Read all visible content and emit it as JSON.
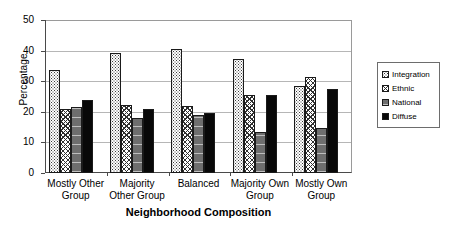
{
  "chart_data": {
    "type": "bar",
    "title": "",
    "xlabel": "Neighborhood Composition",
    "ylabel": "Percentage",
    "ylim": [
      0,
      50
    ],
    "yticks": [
      0,
      10,
      20,
      30,
      40,
      50
    ],
    "grid": true,
    "legend_position": "right",
    "categories": [
      "Mostly Other Group",
      "Majority Other Group",
      "Balanced",
      "Majority Own Group",
      "Mostly Own Group"
    ],
    "category_lines": [
      [
        "Mostly Other",
        "Group"
      ],
      [
        "Majority",
        "Other Group"
      ],
      [
        "Balanced",
        ""
      ],
      [
        "Majority Own",
        "Group"
      ],
      [
        "Mostly Own",
        "Group"
      ]
    ],
    "series": [
      {
        "name": "Integration",
        "pattern": "dotted",
        "values": [
          33.7,
          39.3,
          40.5,
          37.1,
          28.3
        ]
      },
      {
        "name": "Ethnic",
        "pattern": "cross-hatch",
        "values": [
          20.8,
          22.2,
          22.0,
          25.4,
          31.5
        ]
      },
      {
        "name": "National",
        "pattern": "solid-gray",
        "values": [
          21.5,
          18.0,
          18.8,
          13.5,
          14.7
        ]
      },
      {
        "name": "Diffuse",
        "pattern": "solid-black",
        "values": [
          23.9,
          21.0,
          19.7,
          25.4,
          27.3
        ]
      }
    ]
  },
  "legend": {
    "items": [
      {
        "label": "Integration"
      },
      {
        "label": "Ethnic"
      },
      {
        "label": "National"
      },
      {
        "label": "Diffuse"
      }
    ]
  },
  "axis": {
    "y_title": "Percentage",
    "x_title": "Neighborhood Composition",
    "y_ticks": [
      "50",
      "40",
      "30",
      "20",
      "10",
      "0"
    ]
  }
}
